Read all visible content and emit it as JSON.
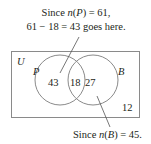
{
  "diagram": {
    "type": "venn",
    "universe_label": "U",
    "sets": [
      {
        "label": "P",
        "total_label": "n(P) = 61"
      },
      {
        "label": "B",
        "total_label": "n(B) = 45"
      }
    ],
    "regions": {
      "p_only": "43",
      "intersection": "18",
      "b_only": "27",
      "outside": "12"
    },
    "annotations": {
      "top_line1_prefix": "Since ",
      "top_line1_func": "n",
      "top_line1_paren": "(",
      "top_line1_set": "P",
      "top_line1_suffix": ") = 61,",
      "top_line2": "61 − 18 = 43 goes here.",
      "bottom_prefix": "Since ",
      "bottom_func": "n",
      "bottom_paren": "(",
      "bottom_set": "B",
      "bottom_suffix": ") = 45."
    },
    "colors": {
      "stroke": "#8a8a8a",
      "text": "#231f20"
    }
  }
}
